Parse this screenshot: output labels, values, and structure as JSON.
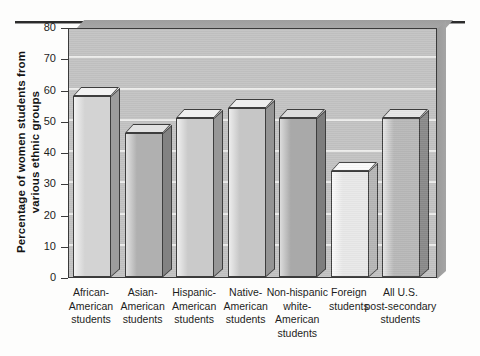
{
  "chart_data": {
    "type": "bar",
    "title": "",
    "subtitle": "",
    "xlabel": "",
    "ylabel": "Percentage of women students from various ethnic groups",
    "ylim": [
      0,
      80
    ],
    "yticks": [
      0,
      10,
      20,
      30,
      40,
      50,
      60,
      70,
      80
    ],
    "ytick_labels": [
      "0",
      "10",
      "20",
      "30",
      "40",
      "50",
      "60",
      "70",
      "80"
    ],
    "grid": true,
    "legend": "none",
    "style": "3d-bar-grayscale",
    "categories": [
      "African-American students",
      "Asian-American students",
      "Hispanic-American students",
      "Native-American students",
      "Non-hispanic white-American students",
      "Foreign students",
      "All U.S. post-secondary students"
    ],
    "category_lines": [
      [
        "African-",
        "American",
        "students"
      ],
      [
        "Asian-",
        "American",
        "students"
      ],
      [
        "Hispanic-",
        "American",
        "students"
      ],
      [
        "Native-",
        "American",
        "students"
      ],
      [
        "Non-hispanic",
        "white-",
        "American",
        "students"
      ],
      [
        "Foreign",
        "students"
      ],
      [
        "All U.S.",
        "post-secondary",
        "students"
      ]
    ],
    "values": [
      58,
      46,
      51,
      54,
      51,
      34,
      51
    ],
    "bar_colors": [
      "#d3d3d3",
      "#b0b0b0",
      "#cacaca",
      "#c6c6c6",
      "#a9a9a9",
      "#e8e8e8",
      "#b8b8b8"
    ],
    "bar_side_colors": [
      "#9d9d9d",
      "#828282",
      "#979797",
      "#949494",
      "#7d7d7d",
      "#b6b6b6",
      "#8a8a8a"
    ],
    "bar_top_colors": [
      "#f2f2f2",
      "#e2e2e2",
      "#efefef",
      "#ededed",
      "#dcdcdc",
      "#fbfbfb",
      "#e6e6e6"
    ],
    "plot_background": "#c3c3c3",
    "gridline_color": "#ececeb",
    "axis_color": "#3a3a3a",
    "page_background": "#fdfdfc"
  }
}
